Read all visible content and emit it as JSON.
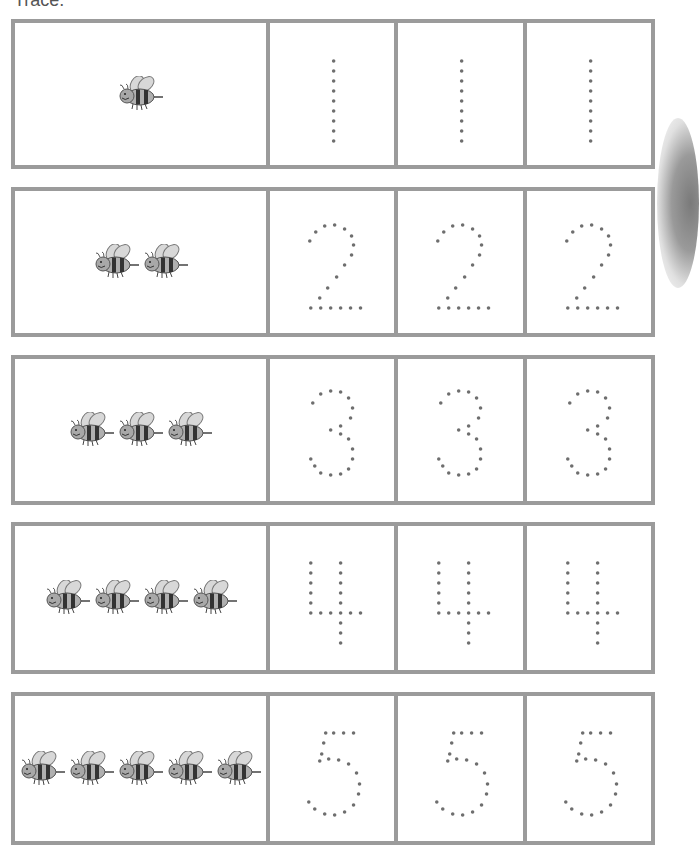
{
  "worksheet": {
    "header": "Trace.",
    "colors": {
      "border": "#9b9b9b",
      "dot": "#6e6e6e",
      "bee_body": "#8a8a8a",
      "bee_stripe": "#333333"
    },
    "rows": [
      {
        "number": "1",
        "bee_count": 1
      },
      {
        "number": "2",
        "bee_count": 2
      },
      {
        "number": "3",
        "bee_count": 3
      },
      {
        "number": "4",
        "bee_count": 4
      },
      {
        "number": "5",
        "bee_count": 5
      }
    ],
    "trace_copies_per_row": 3
  }
}
